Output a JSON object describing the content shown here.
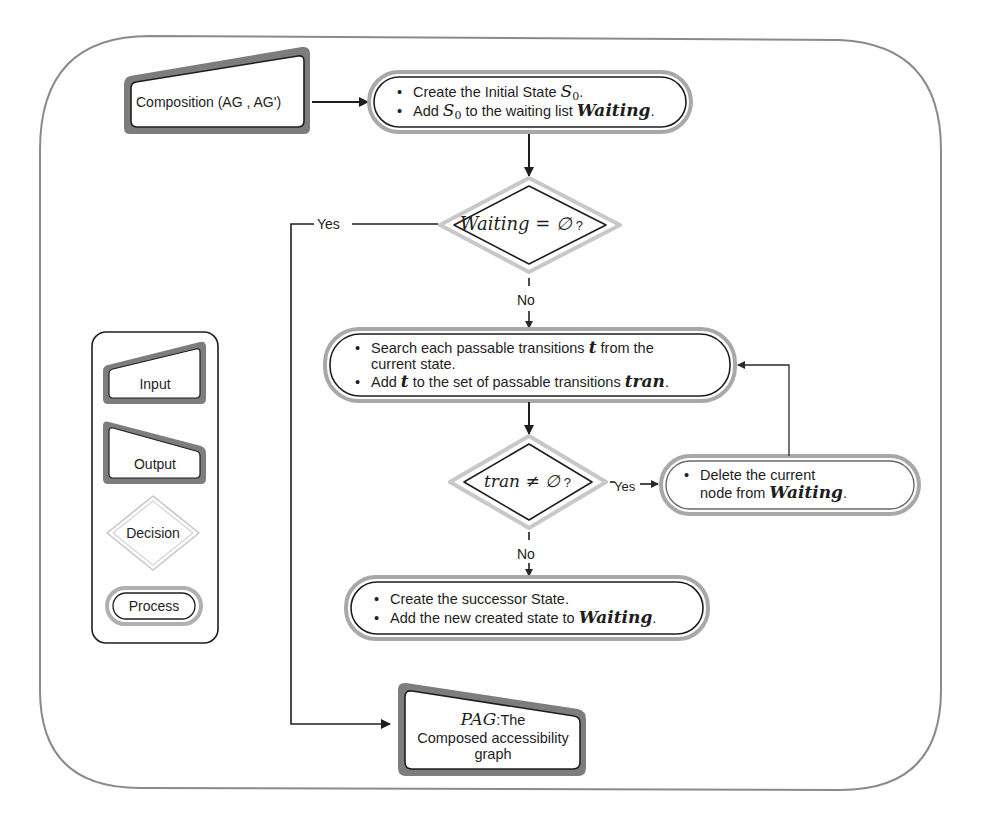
{
  "diagram": {
    "type": "flowchart",
    "input_node": {
      "label": "Composition (AG , AG')"
    },
    "process_init": {
      "line1_prefix": "Create the Initial State ",
      "line1_math": "S",
      "line1_sub": "0",
      "line1_suffix": ".",
      "line2_prefix": "Add ",
      "line2_math": "S",
      "line2_sub": "0",
      "line2_mid": " to the waiting list ",
      "line2_math2": "Waiting",
      "line2_suffix": "."
    },
    "decision_waiting": {
      "math": "Waiting = ∅",
      "suffix": " ?"
    },
    "decision_waiting_yes": "Yes",
    "decision_waiting_no": "No",
    "process_search": {
      "line1_prefix": "Search each passable transitions ",
      "line1_math": "t",
      "line1_suffix": " from the",
      "line1b": "current state.",
      "line2_prefix": "Add ",
      "line2_math": "t",
      "line2_mid": " to the set of passable transitions ",
      "line2_math2": "tran",
      "line2_suffix": "."
    },
    "decision_tran": {
      "math": "tran ≠ ∅",
      "suffix": " ?"
    },
    "decision_tran_yes": "Yes",
    "decision_tran_no": "No",
    "process_delete": {
      "line1": "Delete the current",
      "line2_prefix": "node from ",
      "line2_math": "Waiting",
      "line2_suffix": "."
    },
    "process_successor": {
      "line1": "Create the successor State.",
      "line2_prefix": "Add the new created state  to ",
      "line2_math": "Waiting",
      "line2_suffix": "."
    },
    "output_node": {
      "math": "PAG",
      "line1_suffix": ":The",
      "line2": "Composed accessibility",
      "line3": "graph"
    }
  },
  "legend": {
    "items": [
      {
        "label": "Input"
      },
      {
        "label": "Output"
      },
      {
        "label": "Decision"
      },
      {
        "label": "Process"
      }
    ]
  },
  "colors": {
    "frame": "#8a8a8a",
    "stroke": "#1e1e1e",
    "shape_shadow": "#7a7a7a",
    "double_outline": "#b0b0b0",
    "background": "#ffffff"
  }
}
